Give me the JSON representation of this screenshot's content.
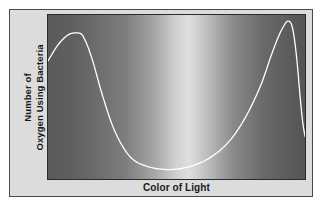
{
  "figure": {
    "caption_present": false,
    "background_color": "#ffffff",
    "panel_color": "#dcdcdc",
    "frame_color": "#4a4a4a"
  },
  "axes": {
    "y_label_line1": "Number of",
    "y_label_line2": "Oxygen Using Bacteria",
    "x_label": "Color of Light",
    "plot_border_color": "#2b2b2b"
  },
  "chart_data": {
    "type": "line",
    "title": "",
    "subtitle": "",
    "xlabel": "Color of Light",
    "ylabel": "Number of Oxygen Using Bacteria",
    "grid": false,
    "legend": null,
    "xlim": [
      0,
      100
    ],
    "ylim": [
      0,
      100
    ],
    "x_tick_labels": [],
    "y_tick_labels": [],
    "curve_color": "#ffffff",
    "curve_width_px": 2,
    "background": {
      "type": "horizontal-gradient",
      "description": "grayscale visible-light spectrum: dark at violet (left) end, brightest near green/yellow center, dark at red (right) end",
      "stops": [
        {
          "pos": 0,
          "color": "#5a5a5a"
        },
        {
          "pos": 12,
          "color": "#626262"
        },
        {
          "pos": 30,
          "color": "#7d7d7d"
        },
        {
          "pos": 42,
          "color": "#a8a8a8"
        },
        {
          "pos": 50,
          "color": "#d2d2d2"
        },
        {
          "pos": 55,
          "color": "#dedede"
        },
        {
          "pos": 62,
          "color": "#bdbdbd"
        },
        {
          "pos": 72,
          "color": "#8a8a8a"
        },
        {
          "pos": 84,
          "color": "#696969"
        },
        {
          "pos": 100,
          "color": "#545454"
        }
      ]
    },
    "series": [
      {
        "name": "Oxygen-using bacteria",
        "x": [
          0,
          4,
          8,
          12,
          14,
          17,
          21,
          25,
          29,
          33,
          38,
          44,
          50,
          56,
          62,
          68,
          73,
          78,
          83,
          87,
          90,
          92,
          93,
          94,
          95,
          96,
          97,
          98,
          99,
          100
        ],
        "y": [
          72,
          82,
          88,
          89,
          86,
          74,
          52,
          33,
          20,
          12,
          8,
          6,
          6,
          8,
          12,
          19,
          28,
          41,
          58,
          76,
          88,
          94,
          96,
          96,
          93,
          84,
          70,
          52,
          36,
          26
        ]
      }
    ],
    "annotations": [
      {
        "text": "left peak near violet/blue end",
        "x": 12,
        "y": 89
      },
      {
        "text": "trough across green/yellow center",
        "x": 47,
        "y": 6
      },
      {
        "text": "right peak near red end",
        "x": 93,
        "y": 96
      }
    ]
  }
}
